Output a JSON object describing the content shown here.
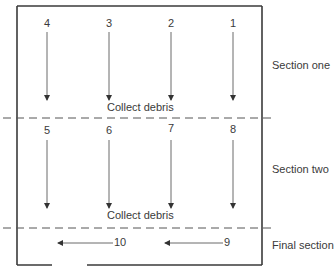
{
  "diagram": {
    "sections": [
      {
        "label": "Section one",
        "columns": [
          "4",
          "3",
          "2",
          "1"
        ],
        "footer": "Collect debris"
      },
      {
        "label": "Section two",
        "columns": [
          "5",
          "6",
          "7",
          "8"
        ],
        "footer": "Collect debris"
      },
      {
        "label": "Final section",
        "arrows": [
          "10",
          "9"
        ]
      }
    ],
    "colors": {
      "line": "#3a3a3a",
      "dash": "#555555"
    }
  }
}
